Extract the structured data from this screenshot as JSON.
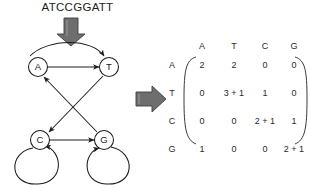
{
  "sequence": {
    "label": "ATCCGGATT"
  },
  "arrows": {
    "down_arrow": "down-block-arrow",
    "right_arrow": "right-block-arrow"
  },
  "graph": {
    "title": "de-bruijn-transition-graph",
    "nodes": [
      {
        "id": "A",
        "label": "A",
        "cx": 38,
        "cy": 67
      },
      {
        "id": "T",
        "label": "T",
        "cx": 109,
        "cy": 67
      },
      {
        "id": "C",
        "label": "C",
        "cx": 40,
        "cy": 140
      },
      {
        "id": "G",
        "label": "G",
        "cx": 104,
        "cy": 140
      }
    ],
    "edges": [
      {
        "from": "A",
        "to": "T",
        "kind": "curved"
      },
      {
        "from": "A",
        "to": "T",
        "kind": "straight"
      },
      {
        "from": "T",
        "to": "C",
        "kind": "straight"
      },
      {
        "from": "G",
        "to": "A",
        "kind": "straight"
      },
      {
        "from": "C",
        "to": "G",
        "kind": "straight"
      },
      {
        "from": "C",
        "to": "C",
        "kind": "self-loop"
      },
      {
        "from": "G",
        "to": "G",
        "kind": "self-loop"
      }
    ]
  },
  "matrix": {
    "name": "transition-count-matrix",
    "col_headers": [
      "A",
      "T",
      "C",
      "G"
    ],
    "row_headers": [
      "A",
      "T",
      "C",
      "G"
    ],
    "rows": [
      [
        "2",
        "2",
        "0",
        "0"
      ],
      [
        "0",
        "3 + 1",
        "1",
        "0"
      ],
      [
        "0",
        "0",
        "2 + 1",
        "1"
      ],
      [
        "1",
        "0",
        "0",
        "2 + 1"
      ]
    ]
  },
  "colors": {
    "stroke": "#1c1c1c",
    "arrow_fill": "#6e6e6e",
    "arrow_stroke": "#3a3a3a",
    "text": "#1c1c1c",
    "background": "#ffffff"
  }
}
